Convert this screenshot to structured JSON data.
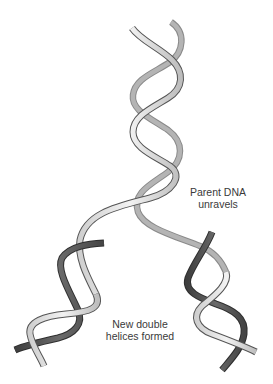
{
  "diagram": {
    "title": "",
    "colors": {
      "background": "#ffffff",
      "parent_strand_fill": "#e6e6e6",
      "parent_strand_shadow": "#a8a8a8",
      "parent_strand_outline": "#555555",
      "new_strand_fill": "#5a5a5a",
      "new_strand_outline": "#333333",
      "label_text": "#3a3a3a"
    },
    "labels": {
      "parent": {
        "line1": "Parent DNA",
        "line2": "unravels"
      },
      "new": {
        "line1": "New double",
        "line2": "helices formed"
      }
    },
    "elements": [
      {
        "id": "parent-double-helix",
        "description": "Light gray twisted double ribbon at top center"
      },
      {
        "id": "left-daughter-helix",
        "description": "Lower-left helix: one light parent strand wound with one dark new strand"
      },
      {
        "id": "right-daughter-helix",
        "description": "Lower-right helix: one light parent strand wound with one dark new strand"
      }
    ]
  }
}
